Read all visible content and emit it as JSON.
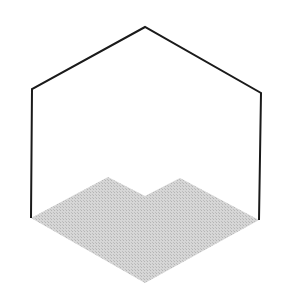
{
  "diagram": {
    "width": 290,
    "height": 295,
    "outline": {
      "stroke": "#1a1a1a",
      "stroke_width": 2,
      "points": [
        [
          31,
          218
        ],
        [
          32,
          89
        ],
        [
          145,
          27
        ],
        [
          261,
          93
        ],
        [
          259,
          220
        ]
      ]
    },
    "floor_region": {
      "fill": "#c8c8c8",
      "points": [
        [
          31,
          218
        ],
        [
          108,
          177
        ],
        [
          145,
          196
        ],
        [
          180,
          178
        ],
        [
          259,
          220
        ],
        [
          145,
          283
        ]
      ]
    }
  }
}
